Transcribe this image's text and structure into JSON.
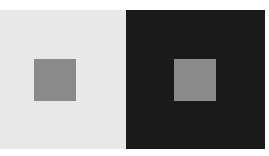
{
  "illusion": {
    "type": "simultaneous-contrast",
    "panels": [
      {
        "name": "light",
        "background": "#e8e8e8",
        "square_color": "#8a8a8a"
      },
      {
        "name": "dark",
        "background": "#1a1a1a",
        "square_color": "#8a8a8a"
      }
    ]
  }
}
